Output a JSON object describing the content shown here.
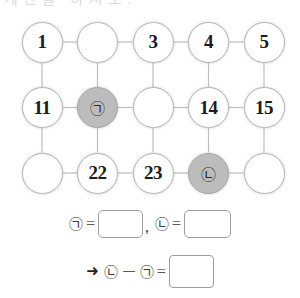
{
  "header": {
    "clipped_text": "계산을 하시오."
  },
  "grid": {
    "columns": 5,
    "rows": 3,
    "cells": [
      {
        "label": "1",
        "filled": false,
        "is_marker": false
      },
      {
        "label": "",
        "filled": false,
        "is_marker": false
      },
      {
        "label": "3",
        "filled": false,
        "is_marker": false
      },
      {
        "label": "4",
        "filled": false,
        "is_marker": false
      },
      {
        "label": "5",
        "filled": false,
        "is_marker": false
      },
      {
        "label": "11",
        "filled": false,
        "is_marker": false
      },
      {
        "label": "㉠",
        "filled": true,
        "is_marker": true
      },
      {
        "label": "",
        "filled": false,
        "is_marker": false
      },
      {
        "label": "14",
        "filled": false,
        "is_marker": false
      },
      {
        "label": "15",
        "filled": false,
        "is_marker": false
      },
      {
        "label": "",
        "filled": false,
        "is_marker": false
      },
      {
        "label": "22",
        "filled": false,
        "is_marker": false
      },
      {
        "label": "23",
        "filled": false,
        "is_marker": false
      },
      {
        "label": "㉡",
        "filled": true,
        "is_marker": true
      },
      {
        "label": "",
        "filled": false,
        "is_marker": false
      }
    ]
  },
  "answers": {
    "line1": {
      "sym_a": "㉠",
      "equals_a": "=",
      "comma": ",",
      "sym_b": "㉡",
      "equals_b": "="
    },
    "line2": {
      "arrow": "➜",
      "sym_b": "㉡",
      "minus": "－",
      "sym_a": "㉠",
      "equals": "="
    }
  },
  "colors": {
    "circle_stroke": "#b4b4b4",
    "circle_fill": "#ffffff",
    "highlight_fill": "#bcbcbc",
    "line": "#bdbdbd",
    "box_border": "#9d9d9d",
    "text": "#1b1b1b"
  }
}
